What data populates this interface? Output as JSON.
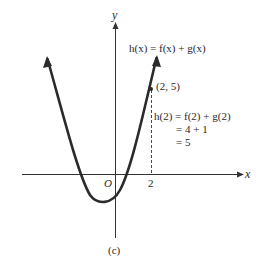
{
  "figure": {
    "caption": "(c)",
    "axes": {
      "x_label": "x",
      "y_label": "y",
      "origin_label": "O",
      "x_tick_label": "2"
    },
    "function_label": "h(x) = f(x) + g(x)",
    "point_label": "(2, 5)",
    "computation": {
      "line1": "h(2) = f(2) + g(2)",
      "line2": "= 4 + 1",
      "line3": "= 5"
    },
    "colors": {
      "curve": "#2b2b2b",
      "axis": "#333333",
      "text": "#2a2a2a",
      "background": "#ffffff"
    }
  }
}
